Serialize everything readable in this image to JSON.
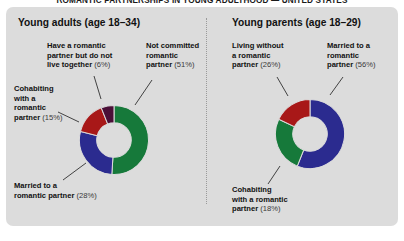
{
  "figure": {
    "title": "ROMANTIC PARTNERSHIPS IN YOUNG ADULTHOOD — UNITED STATES"
  },
  "panels": [
    {
      "id": "left",
      "heading": "Young adults (age 18–34)"
    },
    {
      "id": "right",
      "heading": "Young parents (age 18–29)"
    }
  ],
  "colors": {
    "green": "#16793a",
    "blue": "#2b2b8f",
    "red": "#a81818",
    "maroon": "#4a0f37",
    "panel_bg": "#dcdcdc",
    "page_bg": "#ffffff",
    "text": "#111111"
  },
  "labels": {
    "left": {
      "not_committed": {
        "text": "Not committed\nromantic\npartner",
        "pct": "(51%)"
      },
      "have_partner_not_live": {
        "text": "Have a romantic\npartner but do not\nlive together",
        "pct": "(6%)"
      },
      "cohabiting": {
        "text": "Cohabiting\nwith a\nromantic\npartner",
        "pct": "(15%)"
      },
      "married": {
        "text": "Married to a\nromantic partner",
        "pct": "(28%)"
      }
    },
    "right": {
      "living_without": {
        "text": "Living without\na romantic\npartner",
        "pct": "(26%)"
      },
      "married": {
        "text": "Married to a\nromantic\npartner",
        "pct": "(56%)"
      },
      "cohabiting": {
        "text": "Cohabiting\nwith a romantic\npartner",
        "pct": "(18%)"
      }
    }
  },
  "chart_data": [
    {
      "type": "pie",
      "variant": "donut",
      "title": "Young adults (age 18–34)",
      "categories": [
        "Not committed romantic partner",
        "Married to a romantic partner",
        "Cohabiting with a romantic partner",
        "Have a romantic partner but do not live together"
      ],
      "values": [
        51,
        28,
        15,
        6
      ],
      "unit": "percent",
      "colors": [
        "#16793a",
        "#2b2b8f",
        "#a81818",
        "#4a0f37"
      ],
      "legend": "labels-with-leader-lines",
      "start_angle_deg": 0,
      "direction": "clockwise",
      "inner_radius_ratio": 0.5
    },
    {
      "type": "pie",
      "variant": "donut",
      "title": "Young parents (age 18–29)",
      "categories": [
        "Married to a romantic partner",
        "Living without a romantic partner",
        "Cohabiting with a romantic partner"
      ],
      "values": [
        56,
        26,
        18
      ],
      "unit": "percent",
      "colors": [
        "#2b2b8f",
        "#16793a",
        "#a81818"
      ],
      "legend": "labels-with-leader-lines",
      "start_angle_deg": 0,
      "direction": "clockwise",
      "inner_radius_ratio": 0.5
    }
  ]
}
